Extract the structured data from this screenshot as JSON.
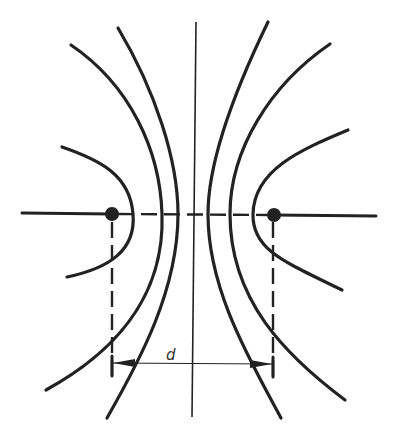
{
  "diagram": {
    "type": "field-lines-two-point-charges",
    "dimension_label": "d",
    "colors": {
      "line": "#222222",
      "background": "#ffffff"
    },
    "charges": [
      {
        "name": "left-charge",
        "x": 112,
        "y": 214
      },
      {
        "name": "right-charge",
        "x": 274,
        "y": 215
      }
    ]
  }
}
